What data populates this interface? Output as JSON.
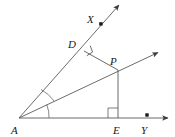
{
  "figure": {
    "type": "geometry-diagram",
    "width": 175,
    "height": 137,
    "background_color": "#ffffff",
    "stroke_color": "#555555",
    "label_color": "#1a1a1a",
    "labels": {
      "A": "A",
      "D": "D",
      "X": "X",
      "P": "P",
      "E": "E",
      "Y": "Y"
    },
    "points": {
      "A": {
        "x": 19,
        "y": 118,
        "label": "A",
        "label_x": 14,
        "label_y": 133
      },
      "D": {
        "x": 84,
        "y": 51,
        "label": "D",
        "label_x": 70,
        "label_y": 48
      },
      "X": {
        "x": 101,
        "y": 24,
        "label": "X",
        "label_x": 90,
        "label_y": 22
      },
      "P": {
        "x": 118,
        "y": 70,
        "label": "P",
        "label_x": 112,
        "label_y": 66
      },
      "E": {
        "x": 118,
        "y": 118,
        "label": "E",
        "label_x": 114,
        "label_y": 133
      },
      "Y": {
        "x": 147,
        "y": 115,
        "label": "Y",
        "label_x": 142,
        "label_y": 133
      }
    },
    "dots": [
      {
        "name": "point-X-dot",
        "x": 101,
        "y": 24
      },
      {
        "name": "point-Y-dot",
        "x": 147,
        "y": 115
      }
    ],
    "rays": [
      {
        "name": "ray-AX",
        "from": "A",
        "through": "X",
        "x1": 19,
        "y1": 118,
        "x2": 119,
        "y2": 5,
        "arrow": true
      },
      {
        "name": "ray-AP",
        "from": "A",
        "through": "P",
        "x1": 19,
        "y1": 118,
        "x2": 159,
        "y2": 52,
        "arrow": true
      },
      {
        "name": "ray-AY",
        "from": "A",
        "through": "Y",
        "x1": 19,
        "y1": 118,
        "x2": 169,
        "y2": 118,
        "arrow": true
      }
    ],
    "segments": [
      {
        "name": "segment-DP",
        "x1": 84,
        "y1": 51,
        "x2": 118,
        "y2": 70
      },
      {
        "name": "segment-PE",
        "x1": 118,
        "y1": 70,
        "x2": 118,
        "y2": 118
      }
    ],
    "right_angles": [
      {
        "name": "right-angle-at-D",
        "vertex": "D",
        "size": 8
      },
      {
        "name": "right-angle-at-E",
        "vertex": "E",
        "size": 10
      }
    ],
    "angle_arcs": [
      {
        "name": "angle-arc-DAP",
        "radius": 36
      },
      {
        "name": "angle-arc-PAE",
        "radius": 30
      }
    ]
  }
}
